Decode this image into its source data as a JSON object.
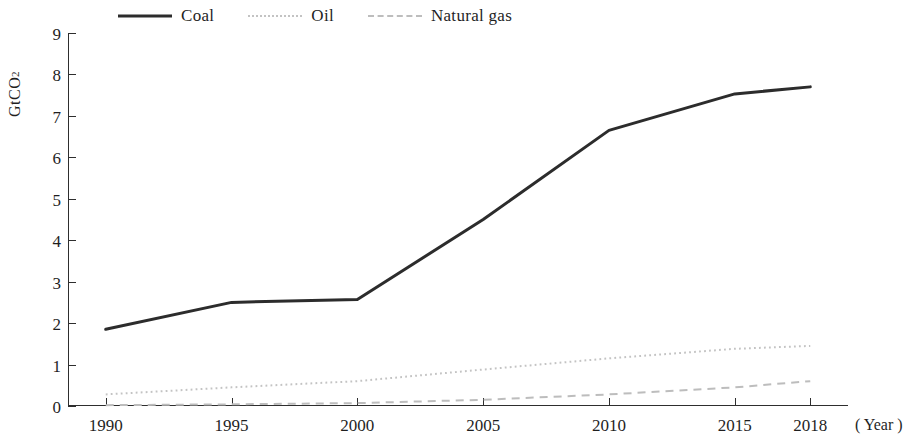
{
  "chart_data": {
    "type": "line",
    "title": "",
    "xlabel": "( Year )",
    "ylabel": "GtCO2",
    "ylabel_base": "GtCO",
    "ylabel_sub": "2",
    "x": [
      1990,
      1995,
      2000,
      2005,
      2010,
      2015,
      2018
    ],
    "categories": [
      "1990",
      "1995",
      "2000",
      "2005",
      "2010",
      "2015",
      "2018"
    ],
    "xlim": [
      1988.5,
      2019.5
    ],
    "ylim": [
      0,
      9
    ],
    "yticks": [
      0,
      1,
      2,
      3,
      4,
      5,
      6,
      7,
      8,
      9
    ],
    "ytick_labels": [
      "0",
      "1",
      "2",
      "3",
      "4",
      "5",
      "6",
      "7",
      "8",
      "9"
    ],
    "grid": false,
    "legend_position": "top-left",
    "series": [
      {
        "name": "Coal",
        "style": "solid",
        "color": "#2c2c2c",
        "width": 3,
        "values": [
          1.85,
          2.5,
          2.57,
          4.5,
          6.65,
          7.53,
          7.7
        ]
      },
      {
        "name": "Oil",
        "style": "dotted",
        "color": "#c3c3c3",
        "width": 2,
        "values": [
          0.28,
          0.45,
          0.6,
          0.88,
          1.15,
          1.38,
          1.45
        ]
      },
      {
        "name": "Natural gas",
        "style": "dashed",
        "color": "#bdbdbd",
        "width": 2,
        "values": [
          0.02,
          0.04,
          0.07,
          0.15,
          0.28,
          0.45,
          0.6
        ]
      }
    ]
  },
  "legend": {
    "items": [
      {
        "label": "Coal"
      },
      {
        "label": "Oil"
      },
      {
        "label": "Natural gas"
      }
    ]
  }
}
